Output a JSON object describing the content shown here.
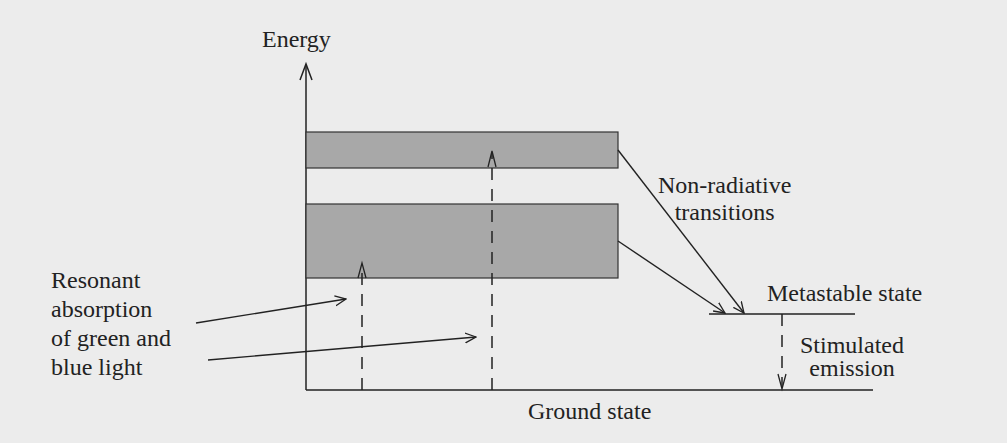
{
  "axis": {
    "y_label": "Energy"
  },
  "levels": {
    "upper_band": {
      "label": "",
      "y_top": 132,
      "y_bottom": 168
    },
    "lower_band": {
      "label": "",
      "y_top": 204,
      "y_bottom": 278
    },
    "metastable": {
      "label": "Metastable state"
    },
    "ground": {
      "label": "Ground state"
    }
  },
  "annotations": {
    "absorption": [
      "Resonant",
      "absorption",
      "of green and",
      "blue light"
    ],
    "non_radiative": [
      "Non-radiative",
      "transitions"
    ],
    "stimulated": [
      "Stimulated",
      "emission"
    ]
  },
  "colors": {
    "band_fill": "#a8a8a8",
    "line": "#222222",
    "background": "#ececec"
  }
}
